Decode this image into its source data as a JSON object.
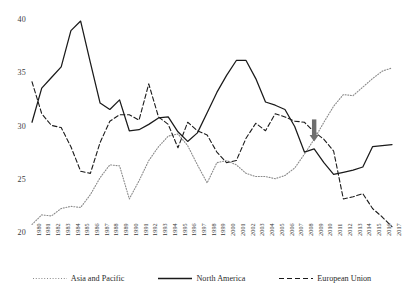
{
  "chart_data": {
    "type": "line",
    "title": "",
    "subtitle": "",
    "xlabel": "",
    "ylabel": "",
    "xlim": [
      1980,
      2017
    ],
    "ylim": [
      20,
      40
    ],
    "yticks": [
      20,
      25,
      30,
      35,
      40
    ],
    "grid": false,
    "legend_position": "bottom",
    "x": [
      1980,
      1981,
      1982,
      1983,
      1984,
      1985,
      1986,
      1987,
      1988,
      1989,
      1990,
      1991,
      1992,
      1993,
      1994,
      1995,
      1996,
      1997,
      1998,
      1999,
      2000,
      2001,
      2002,
      2003,
      2004,
      2005,
      2006,
      2007,
      2008,
      2009,
      2010,
      2011,
      2012,
      2013,
      2014,
      2015,
      2016,
      2017
    ],
    "categories": [
      "1980",
      "1981",
      "1982",
      "1983",
      "1984",
      "1985",
      "1986",
      "1987",
      "1988",
      "1989",
      "1990",
      "1991",
      "1992",
      "1993",
      "1994",
      "1995",
      "1996",
      "1997",
      "1998",
      "1999",
      "2000",
      "2001",
      "2002",
      "2003",
      "2004",
      "2005",
      "2006",
      "2007",
      "2008",
      "2009",
      "2010",
      "2011",
      "2012",
      "2013",
      "2014",
      "2015",
      "2016",
      "2017"
    ],
    "series": [
      {
        "name": "Asia and Pacific",
        "style": "dotted",
        "color": "#8a8a8a",
        "values": [
          20.8,
          21.7,
          21.6,
          22.3,
          22.5,
          22.4,
          23.6,
          25.2,
          26.4,
          26.3,
          23.2,
          24.9,
          26.8,
          28.1,
          29.1,
          29.3,
          28.2,
          26.4,
          24.7,
          26.6,
          26.8,
          26.4,
          25.6,
          25.3,
          25.3,
          25.1,
          25.4,
          26.1,
          27.4,
          28.8,
          30.4,
          31.9,
          33.0,
          32.9,
          33.7,
          34.5,
          35.2,
          35.5
        ]
      },
      {
        "name": "North America",
        "style": "solid",
        "color": "#1a1a1a",
        "values": [
          30.4,
          33.6,
          34.6,
          35.6,
          39.0,
          39.9,
          36.0,
          32.2,
          31.6,
          32.5,
          29.6,
          29.7,
          30.2,
          30.8,
          30.9,
          29.5,
          28.6,
          29.4,
          31.3,
          33.2,
          34.8,
          36.2,
          36.2,
          34.5,
          32.3,
          32.0,
          31.6,
          30.0,
          27.6,
          27.9,
          26.6,
          25.5,
          25.7,
          25.9,
          26.2,
          28.1,
          28.2,
          28.3
        ]
      },
      {
        "name": "European Union",
        "style": "dashed",
        "color": "#1a1a1a",
        "values": [
          34.2,
          31.2,
          30.1,
          29.9,
          28.1,
          25.8,
          25.6,
          28.5,
          30.5,
          31.1,
          31.1,
          30.6,
          34.0,
          30.9,
          30.2,
          28.0,
          30.4,
          29.6,
          29.2,
          27.6,
          26.6,
          26.8,
          28.9,
          30.3,
          29.6,
          31.2,
          30.9,
          30.5,
          30.4,
          29.5,
          28.8,
          27.7,
          23.2,
          23.4,
          23.7,
          22.3,
          21.5,
          20.6
        ]
      }
    ],
    "annotations": [
      {
        "name": "crisis-arrow",
        "type": "arrow-down",
        "x": 2009,
        "y_tip": 28.6,
        "color": "#6e6e6e"
      }
    ]
  },
  "legend": {
    "items": [
      {
        "label": "Asia and Pacific",
        "style": "dotted"
      },
      {
        "label": "North America",
        "style": "solid"
      },
      {
        "label": "European Union",
        "style": "dashed"
      }
    ]
  }
}
